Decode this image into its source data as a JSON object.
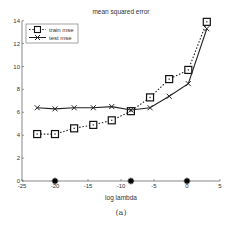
{
  "chart_data": {
    "type": "line",
    "title": "mean squared error",
    "xlabel": "log lambda",
    "ylabel": "",
    "caption": "(a)",
    "xlim": [
      -25,
      5
    ],
    "ylim": [
      0,
      14
    ],
    "xticks": [
      -25,
      -20,
      -15,
      -10,
      -5,
      0,
      5
    ],
    "yticks": [
      0,
      2,
      4,
      6,
      8,
      10,
      12,
      14
    ],
    "grid": false,
    "legend_position": "upper-left",
    "x": [
      -22.7,
      -20,
      -17.1,
      -14.2,
      -11.4,
      -8.5,
      -5.6,
      -2.7,
      0.2,
      3
    ],
    "series": [
      {
        "name": "train mse",
        "style": "dotted",
        "marker": "square",
        "values": [
          4.1,
          4.1,
          4.6,
          4.9,
          5.3,
          6.1,
          7.3,
          8.9,
          9.7,
          13.9
        ]
      },
      {
        "name": "test mse",
        "style": "solid",
        "marker": "x",
        "values": [
          6.4,
          6.3,
          6.4,
          6.4,
          6.5,
          6.2,
          6.4,
          7.4,
          8.5,
          13.3
        ]
      }
    ],
    "annotations": [
      {
        "type": "star-marker",
        "x": -20,
        "y": 0
      },
      {
        "type": "star-marker",
        "x": -8.5,
        "y": 0
      },
      {
        "type": "star-marker",
        "x": 0,
        "y": 0
      }
    ]
  }
}
